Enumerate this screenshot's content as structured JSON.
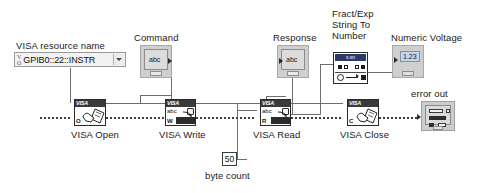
{
  "diagram": {
    "controls": {
      "visa_resource": {
        "label": "VISA resource name",
        "value": "GPIB0::22::INSTR",
        "icon": "visa-resource-icon",
        "dropdown_icon": "chevron-down-icon"
      }
    },
    "indicators": {
      "command": {
        "label": "Command",
        "datatype": "abc"
      },
      "response": {
        "label": "Response",
        "datatype": "abc"
      },
      "numeric_voltage": {
        "label": "Numeric Voltage",
        "value": "1.23"
      },
      "error_out": {
        "label": "error out"
      }
    },
    "constants": {
      "byte_count": {
        "label": "byte count",
        "value": "50"
      }
    },
    "functions": [
      {
        "id": "visa_open",
        "label": "VISA Open",
        "header": "VISA",
        "corner": "O",
        "icon": "visa-open-icon"
      },
      {
        "id": "visa_write",
        "label": "VISA Write",
        "header": "VISA",
        "corner": "W",
        "row": "abc",
        "icon": "visa-write-icon"
      },
      {
        "id": "visa_read",
        "label": "VISA Read",
        "header": "VISA",
        "corner": "R",
        "row": "abc",
        "icon": "visa-read-icon"
      },
      {
        "id": "visa_close",
        "label": "VISA Close",
        "header": "VISA",
        "corner": "C",
        "icon": "visa-close-icon"
      }
    ],
    "primitives": [
      {
        "id": "fract_exp_string_to_number",
        "label": "Fract/Exp\nString To\nNumber",
        "badge": "s.sn",
        "icon": "string-to-number-icon"
      }
    ],
    "colors": {
      "wire": "#6e6e6e",
      "error_wire": "#3d3d3d",
      "terminal_fill": "#cfcfcf",
      "vi_header": "#3a3a3a",
      "primitive_bar": "#2d3a66",
      "numeric_fill": "#c9d4e6",
      "background": "#ffffff"
    }
  }
}
